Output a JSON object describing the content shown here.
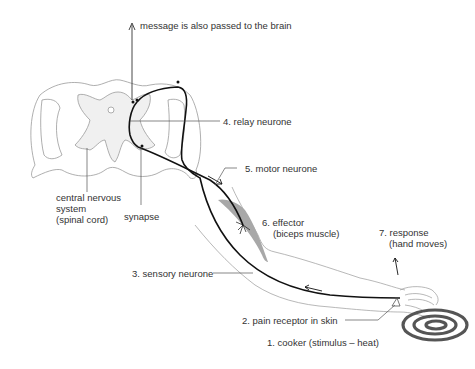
{
  "diagram": {
    "labels": {
      "brain": "message is also passed to the brain",
      "relay": "4. relay neurone",
      "motor": "5. motor neurone",
      "cns_line1": "central nervous",
      "cns_line2": "system",
      "cns_line3": "(spinal cord)",
      "synapse": "synapse",
      "effector_line1": "6. effector",
      "effector_line2": "(biceps muscle)",
      "response_line1": "7. response",
      "response_line2": "(hand moves)",
      "sensory": "3. sensory neurone",
      "receptor": "2. pain receptor in skin",
      "stimulus": "1. cooker (stimulus – heat)"
    },
    "colors": {
      "outline": "#9a9a9a",
      "grey_matter": "#f0f0f0",
      "neurone": "#111111",
      "muscle": "#a8a8a8",
      "cooker": "#555555",
      "text": "#333333"
    }
  }
}
